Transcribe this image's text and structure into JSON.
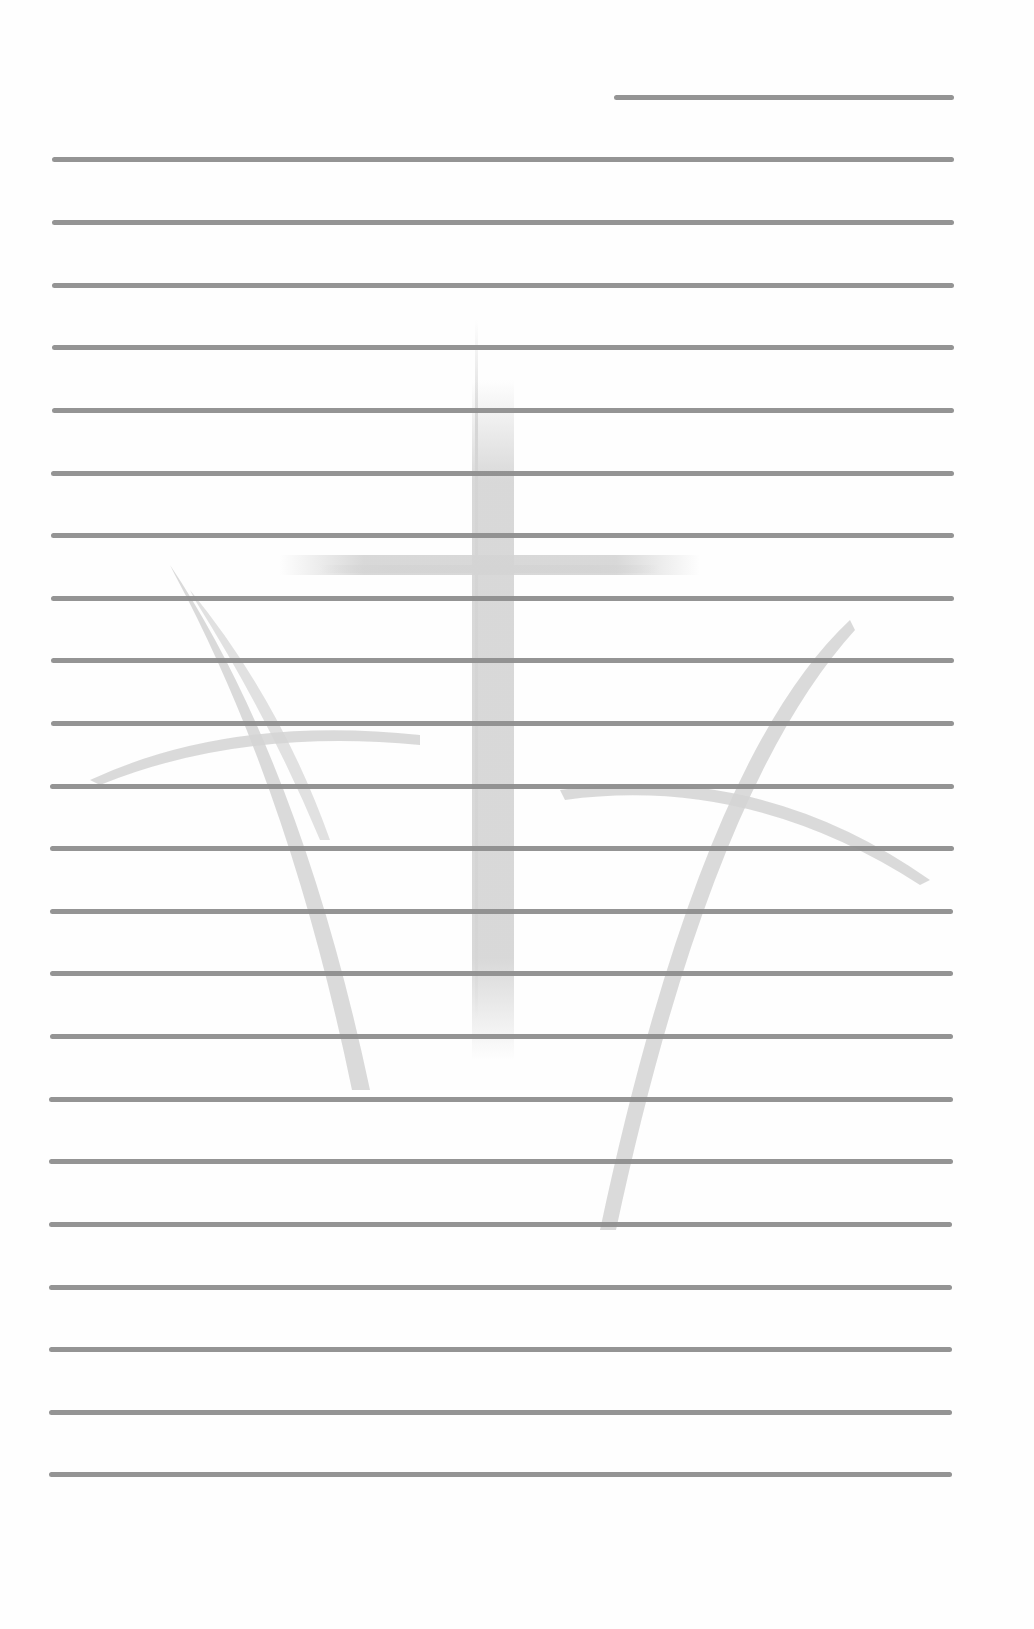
{
  "page": {
    "type": "lined stationery",
    "background_color": "#fefefe",
    "rule_color": "#8e8e8e",
    "watermark": {
      "icon": "three-crosses-icon",
      "color": "#cfcfcf"
    },
    "date_line": {
      "x1": 614,
      "x2": 954,
      "y": 97
    },
    "rules": [
      {
        "x1": 52,
        "x2": 954,
        "y": 159
      },
      {
        "x1": 52,
        "x2": 954,
        "y": 222
      },
      {
        "x1": 52,
        "x2": 954,
        "y": 285
      },
      {
        "x1": 52,
        "x2": 954,
        "y": 347
      },
      {
        "x1": 52,
        "x2": 954,
        "y": 410
      },
      {
        "x1": 51,
        "x2": 954,
        "y": 473
      },
      {
        "x1": 51,
        "x2": 954,
        "y": 535
      },
      {
        "x1": 51,
        "x2": 954,
        "y": 598
      },
      {
        "x1": 51,
        "x2": 954,
        "y": 660
      },
      {
        "x1": 51,
        "x2": 954,
        "y": 723
      },
      {
        "x1": 50,
        "x2": 954,
        "y": 786
      },
      {
        "x1": 50,
        "x2": 954,
        "y": 848
      },
      {
        "x1": 50,
        "x2": 953,
        "y": 911
      },
      {
        "x1": 50,
        "x2": 953,
        "y": 973
      },
      {
        "x1": 50,
        "x2": 953,
        "y": 1036
      },
      {
        "x1": 49,
        "x2": 953,
        "y": 1099
      },
      {
        "x1": 49,
        "x2": 953,
        "y": 1161
      },
      {
        "x1": 49,
        "x2": 952,
        "y": 1224
      },
      {
        "x1": 49,
        "x2": 952,
        "y": 1287
      },
      {
        "x1": 49,
        "x2": 952,
        "y": 1349
      },
      {
        "x1": 49,
        "x2": 952,
        "y": 1412
      },
      {
        "x1": 49,
        "x2": 952,
        "y": 1474
      }
    ]
  }
}
